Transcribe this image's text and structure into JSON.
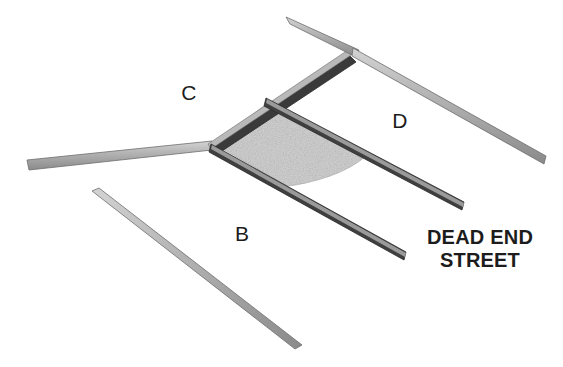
{
  "diagram": {
    "background_color": "#ffffff",
    "road_fill_top": "#c9c9c9",
    "road_fill_bottom": "#8f8f8f",
    "road_edge_color": "#2b2b2b",
    "parcel_fill_color": "#d2d2d2",
    "parcel_edge_color": "#bdbdbd"
  },
  "labels": {
    "b": "B",
    "c": "C",
    "d": "D",
    "dead_end_line1": "DEAD END",
    "dead_end_line2": "STREET"
  },
  "roads": [
    {
      "id": "road-c-west",
      "name": "street-c-west-leg",
      "from": [
        28,
        165
      ],
      "to": [
        212,
        146
      ]
    },
    {
      "id": "road-b-southwest",
      "name": "street-b-southwest-leg",
      "from": [
        95,
        196
      ],
      "to": [
        297,
        346
      ]
    },
    {
      "id": "road-c-northeast",
      "name": "street-c-northeast-leg",
      "from": [
        212,
        146
      ],
      "to": [
        353,
        52
      ]
    },
    {
      "id": "road-top-northwest",
      "name": "street-top-northwest-stub",
      "from": [
        287,
        20
      ],
      "to": [
        353,
        52
      ]
    },
    {
      "id": "road-d-east",
      "name": "street-d-east-leg",
      "from": [
        353,
        52
      ],
      "to": [
        546,
        160
      ]
    },
    {
      "id": "road-dead-end-upper",
      "name": "dead-end-street-upper",
      "from": [
        268,
        100
      ],
      "to": [
        464,
        206
      ]
    },
    {
      "id": "road-dead-end-lower",
      "name": "dead-end-street-lower",
      "from": [
        212,
        146
      ],
      "to": [
        405,
        256
      ]
    }
  ],
  "parcel": {
    "name": "shaded-parcel",
    "description": "shaded block bounded by streets with concave east edge"
  }
}
